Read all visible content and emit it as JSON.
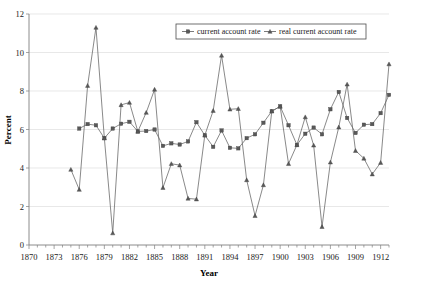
{
  "chart_data": {
    "type": "line",
    "title": "",
    "xlabel": "Year",
    "ylabel": "Percent",
    "xlim": [
      1870,
      1913
    ],
    "ylim": [
      0,
      12
    ],
    "ytick_step": 2,
    "yticks": [
      0,
      2,
      4,
      6,
      8,
      10,
      12
    ],
    "xticks": [
      1870,
      1873,
      1876,
      1879,
      1882,
      1885,
      1888,
      1891,
      1894,
      1897,
      1900,
      1903,
      1906,
      1909,
      1912
    ],
    "xtick_minor_step": 1,
    "grid": "horizontal",
    "legend_position": "top-center",
    "x": [
      1875,
      1876,
      1877,
      1878,
      1879,
      1880,
      1881,
      1882,
      1883,
      1884,
      1885,
      1886,
      1887,
      1888,
      1889,
      1890,
      1891,
      1892,
      1893,
      1894,
      1895,
      1896,
      1897,
      1898,
      1899,
      1900,
      1901,
      1902,
      1903,
      1904,
      1905,
      1906,
      1907,
      1908,
      1909,
      1910,
      1911,
      1912,
      1913
    ],
    "series": [
      {
        "name": "current account rate",
        "marker": "square",
        "color": "#595959",
        "values": [
          null,
          6.05,
          6.28,
          6.22,
          5.55,
          6.05,
          6.3,
          6.4,
          5.9,
          5.92,
          6.0,
          5.15,
          5.28,
          5.22,
          5.38,
          6.38,
          5.7,
          5.1,
          5.95,
          5.05,
          5.02,
          5.55,
          5.75,
          6.35,
          6.95,
          7.2,
          6.22,
          5.2,
          5.78,
          6.1,
          5.75,
          7.05,
          7.95,
          6.6,
          5.82,
          6.25,
          6.28,
          6.85,
          7.8
        ]
      },
      {
        "name": "real current account rate",
        "marker": "triangle",
        "color": "#595959",
        "values": [
          3.92,
          2.88,
          8.28,
          11.3,
          5.55,
          0.62,
          7.28,
          7.4,
          5.9,
          6.88,
          8.08,
          2.98,
          4.22,
          4.15,
          2.42,
          2.38,
          5.7,
          6.98,
          9.85,
          7.05,
          7.08,
          3.38,
          1.52,
          3.12,
          6.95,
          7.2,
          4.22,
          5.2,
          6.65,
          5.18,
          0.95,
          4.3,
          6.12,
          8.35,
          4.9,
          4.5,
          3.68,
          4.28,
          9.4
        ]
      }
    ]
  },
  "axes": {
    "ylabel": "Percent",
    "xlabel": "Year",
    "ytick_labels": [
      "0",
      "2",
      "4",
      "6",
      "8",
      "10",
      "12"
    ],
    "xtick_labels": [
      "1870",
      "1873",
      "1876",
      "1879",
      "1882",
      "1885",
      "1888",
      "1891",
      "1894",
      "1897",
      "1900",
      "1903",
      "1906",
      "1909",
      "1912"
    ]
  },
  "legend": {
    "items": [
      {
        "label": "current account rate",
        "marker": "square"
      },
      {
        "label": "real current account rate",
        "marker": "triangle"
      }
    ]
  },
  "colors": {
    "series": "#595959",
    "grid": "#d9d9d9",
    "axis": "#808080",
    "text": "#1a1a1a",
    "background": "#ffffff"
  }
}
